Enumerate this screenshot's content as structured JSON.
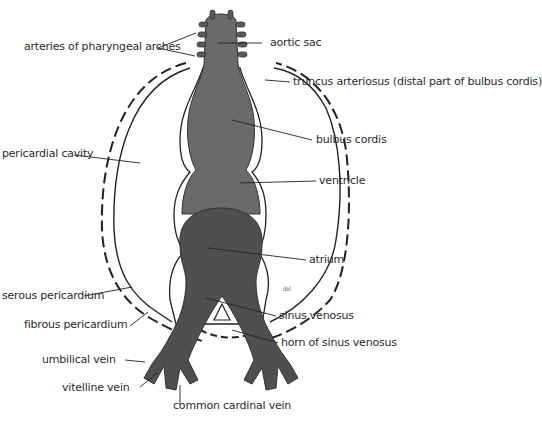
{
  "figure": {
    "type": "anatomical-diagram",
    "colors": {
      "heart_tube": "#6a6a6a",
      "atrium_sinus": "#4f4f4f",
      "outline": "#222222",
      "label_text": "#2b2b2b",
      "background": "#ffffff"
    },
    "signature": "ibl."
  },
  "labels": {
    "arteries_pharyngeal_arches": "arteries of pharyngeal arches",
    "aortic_sac": "aortic sac",
    "truncus_arteriosus": "truncus arteriosus (distal part of bulbus cordis)",
    "pericardial_cavity": "pericardial cavity",
    "bulbus_cordis": "bulbus cordis",
    "ventricle": "ventricle",
    "atrium": "atrium",
    "serous_pericardium": "serous pericardium",
    "fibrous_pericardium": "fibrous pericardium",
    "sinus_venosus": "sinus venosus",
    "horn_sinus_venosus": "horn of sinus venosus",
    "umbilical_vein": "umbilical vein",
    "vitelline_vein": "vitelline vein",
    "common_cardinal_vein": "common cardinal vein"
  }
}
